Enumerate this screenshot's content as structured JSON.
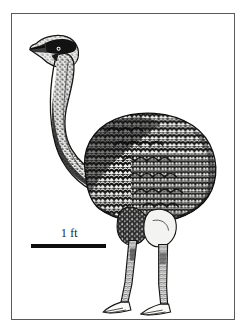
{
  "figure": {
    "kind": "scientific-illustration",
    "technique": "black and white stipple / hatched engraving",
    "background_color": "#ffffff",
    "ink_color": "#111111",
    "frame": {
      "color": "#5a5a5c",
      "thickness_px": 1.5,
      "inset_left_px": 11,
      "inset_top_px": 13,
      "width_px": 224,
      "height_px": 307
    },
    "scale_bar": {
      "label": "1 ft",
      "bar_color": "#0d0d0d",
      "bar_length_px": 75,
      "bar_thickness_px": 3.5,
      "label_position": "above-bar-center"
    },
    "anatomy_notes": {
      "head": "small head with dark eye stripe and pale bill, upper left",
      "neck": "long slender curved neck, stippled gray",
      "body": "large ovoid body with dense scalloped feather barring",
      "legs": "two long bare legs, left leg forward",
      "feet": "three-toed feet pointing left at ground line"
    }
  }
}
